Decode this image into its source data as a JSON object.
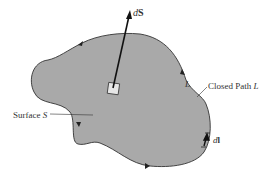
{
  "diagram": {
    "type": "surface-and-closed-path",
    "colors": {
      "surface_fill": "#a9a9a9",
      "boundary": "#333333",
      "arrow": "#111111",
      "patch_fill": "#e6e6e6",
      "text": "#333333",
      "background": "#ffffff"
    },
    "labels": {
      "normal_vector": {
        "prefix": "d",
        "symbol": "S"
      },
      "path_near": "L",
      "closed_path": {
        "text": "Closed Path ",
        "symbol": "L"
      },
      "surface": {
        "text": "Surface ",
        "symbol": "S"
      },
      "line_element": {
        "prefix": "d",
        "symbol": "l"
      }
    }
  }
}
